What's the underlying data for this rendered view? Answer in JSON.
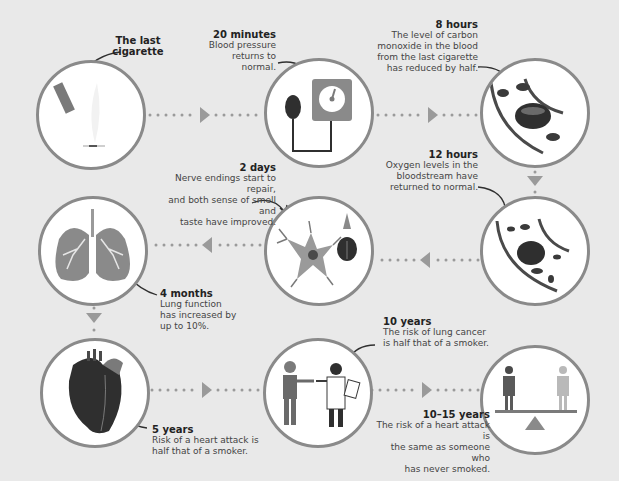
{
  "colors": {
    "background": "#e9e9e9",
    "circle_border": "#8a8a8a",
    "circle_fill": "#ffffff",
    "connector": "#9a9a9a",
    "dark": "#2f2f2f",
    "mid_gray": "#7a7a7a",
    "light_gray": "#b9b9b9"
  },
  "steps": [
    {
      "title": "The last cigarette",
      "title_lines": [
        "The last",
        "cigarette"
      ],
      "body": "",
      "icon": "cigarette-icon"
    },
    {
      "title": "20 minutes",
      "body_lines": [
        "Blood pressure",
        "returns to normal."
      ],
      "icon": "blood-pressure-monitor-icon"
    },
    {
      "title": "8 hours",
      "body_lines": [
        "The level of carbon",
        "monoxide in the blood",
        "from the last cigarette",
        "has reduced by half."
      ],
      "icon": "blood-cells-icon"
    },
    {
      "title": "12 hours",
      "body_lines": [
        "Oxygen levels in the",
        "bloodstream have",
        "returned to normal."
      ],
      "icon": "blood-vessel-icon"
    },
    {
      "title": "2 days",
      "body_lines": [
        "Nerve endings start to repair,",
        "and both sense of smell and",
        "taste have improved."
      ],
      "icon": "nerve-cell-icon"
    },
    {
      "title": "4 months",
      "body_lines": [
        "Lung function",
        "has increased by",
        "up to 10%."
      ],
      "icon": "lungs-icon"
    },
    {
      "title": "5 years",
      "body_lines": [
        "Risk of a heart attack is",
        "half that of a smoker."
      ],
      "icon": "heart-icon"
    },
    {
      "title": "10 years",
      "body_lines": [
        "The risk of lung cancer",
        "is half that of a smoker."
      ],
      "icon": "doctor-handshake-icon"
    },
    {
      "title": "10–15 years",
      "body_lines": [
        "The risk of a heart attack is",
        "the same as someone who",
        "has never smoked."
      ],
      "icon": "balance-scale-icon"
    }
  ]
}
